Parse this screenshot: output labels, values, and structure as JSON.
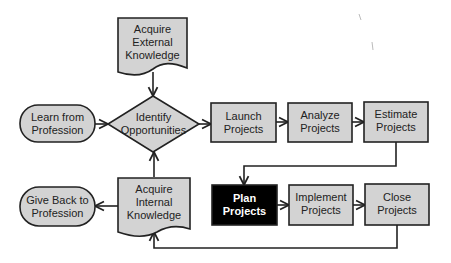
{
  "diagram": {
    "type": "flowchart",
    "colors": {
      "node_fill": "#d3d3d3",
      "node_stroke": "#222222",
      "highlight_fill": "#000000",
      "highlight_text": "#ffffff",
      "edge": "#222222"
    },
    "nodes": {
      "acquire_external": {
        "label": "Acquire\nExternal\nKnowledge",
        "shape": "document"
      },
      "learn_from_profession": {
        "label": "Learn from\nProfession",
        "shape": "terminator"
      },
      "identify_opportunities": {
        "label": "Identify\nOpportunities",
        "shape": "decision"
      },
      "launch_projects": {
        "label": "Launch\nProjects",
        "shape": "process"
      },
      "analyze_projects": {
        "label": "Analyze\nProjects",
        "shape": "process"
      },
      "estimate_projects": {
        "label": "Estimate\nProjects",
        "shape": "process"
      },
      "give_back": {
        "label": "Give Back to\nProfession",
        "shape": "terminator"
      },
      "acquire_internal": {
        "label": "Acquire\nInternal\nKnowledge",
        "shape": "document"
      },
      "plan_projects": {
        "label": "Plan\nProjects",
        "shape": "process",
        "highlighted": true
      },
      "implement_projects": {
        "label": "Implement\nProjects",
        "shape": "process"
      },
      "close_projects": {
        "label": "Close\nProjects",
        "shape": "process"
      }
    },
    "edges": [
      {
        "from": "acquire_external",
        "to": "identify_opportunities"
      },
      {
        "from": "learn_from_profession",
        "to": "identify_opportunities"
      },
      {
        "from": "identify_opportunities",
        "to": "launch_projects"
      },
      {
        "from": "launch_projects",
        "to": "analyze_projects"
      },
      {
        "from": "analyze_projects",
        "to": "estimate_projects"
      },
      {
        "from": "estimate_projects",
        "to": "plan_projects"
      },
      {
        "from": "plan_projects",
        "to": "implement_projects"
      },
      {
        "from": "implement_projects",
        "to": "close_projects"
      },
      {
        "from": "close_projects",
        "to": "acquire_internal"
      },
      {
        "from": "acquire_internal",
        "to": "identify_opportunities"
      },
      {
        "from": "acquire_internal",
        "to": "give_back"
      }
    ]
  }
}
